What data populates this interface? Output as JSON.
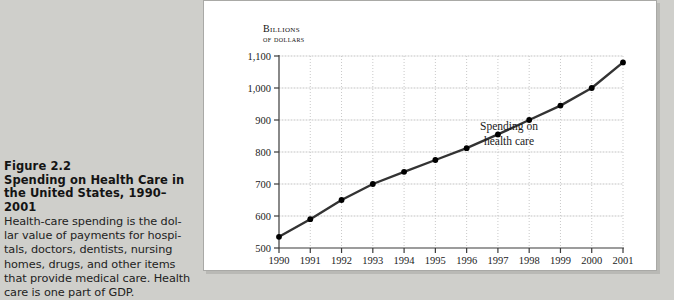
{
  "figure": {
    "number": "Figure 2.2",
    "title_line1": "Spending on Health Care in",
    "title_line2": "the United States, 1990–2001",
    "body_line1": "Health-care spending is the dol-",
    "body_line2": "lar value of payments for hospi-",
    "body_line3": "tals, doctors, dentists, nursing",
    "body_line4": "homes, drugs, and other items",
    "body_line5": "that provide medical care. Health",
    "body_line6": "care is one part of GDP."
  },
  "chart_data": {
    "type": "line",
    "title": "",
    "ylabel_line1": "Billions",
    "ylabel_line2": "of dollars",
    "xlabel": "",
    "annotation_line1": "Spending on",
    "annotation_line2": "health care",
    "categories": [
      "1990",
      "1991",
      "1992",
      "1993",
      "1994",
      "1995",
      "1996",
      "1997",
      "1998",
      "1999",
      "2000",
      "2001"
    ],
    "values": [
      535,
      590,
      650,
      700,
      738,
      775,
      812,
      855,
      900,
      945,
      1000,
      1080
    ],
    "series": [
      {
        "name": "Spending on health care",
        "values": [
          535,
          590,
          650,
          700,
          738,
          775,
          812,
          855,
          900,
          945,
          1000,
          1080
        ]
      }
    ],
    "ytick_labels": [
      "500",
      "600",
      "700",
      "800",
      "900",
      "1,000",
      "1,100"
    ],
    "ytick_values": [
      500,
      600,
      700,
      800,
      900,
      1000,
      1100
    ],
    "ylim": [
      500,
      1100
    ],
    "grid": true,
    "legend_position": "none",
    "line_color": "#333333",
    "marker_color": "#000000",
    "grid_color": "#c9c9c9"
  }
}
